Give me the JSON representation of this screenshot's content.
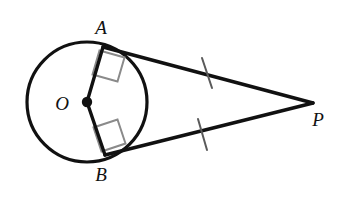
{
  "figure": {
    "background_color": "#ffffff",
    "stroke_color": "#111111",
    "right_angle_color": "#8a8a8a",
    "tick_color": "#5a5a5a",
    "width": 358,
    "height": 199
  },
  "labels": {
    "center": "O",
    "tangent_point_upper": "A",
    "tangent_point_lower": "B",
    "external_point": "P"
  },
  "geometry": {
    "circle": {
      "center_x": 87,
      "center_y": 102,
      "radius": 60,
      "stroke_width": 3.2
    },
    "points": {
      "O": {
        "x": 87,
        "y": 102
      },
      "A": {
        "x": 103,
        "y": 47
      },
      "B": {
        "x": 105,
        "y": 155
      },
      "P": {
        "x": 313,
        "y": 103
      }
    },
    "label_positions": {
      "O": {
        "x": 62,
        "y": 110
      },
      "A": {
        "x": 101,
        "y": 34
      },
      "B": {
        "x": 101,
        "y": 181
      },
      "P": {
        "x": 318,
        "y": 126
      }
    },
    "segments": [
      {
        "name": "radius-OA",
        "x1": 87,
        "y1": 102,
        "x2": 103,
        "y2": 47,
        "width": 3.4
      },
      {
        "name": "radius-OB",
        "x1": 87,
        "y1": 102,
        "x2": 105,
        "y2": 155,
        "width": 3.4
      },
      {
        "name": "tangent-AP",
        "x1": 103,
        "y1": 47,
        "x2": 313,
        "y2": 103,
        "width": 3.4
      },
      {
        "name": "tangent-BP",
        "x1": 105,
        "y1": 155,
        "x2": 313,
        "y2": 103,
        "width": 3.4
      }
    ],
    "right_angle_marks": [
      {
        "name": "right-angle-at-A",
        "points": "99.5,50.5 124.5,57.5 117.5,81.5 92.5,74.5",
        "width": 2.0
      },
      {
        "name": "right-angle-at-B",
        "points": "101.5,151.5 125.5,143.5 117.5,119.5 93.5,127.5",
        "width": 2.0
      }
    ],
    "tick_marks": [
      {
        "name": "congruence-tick-AP",
        "x1": 202,
        "y1": 58,
        "x2": 212,
        "y2": 88,
        "width": 2.0
      },
      {
        "name": "congruence-tick-BP",
        "x1": 198,
        "y1": 119,
        "x2": 207,
        "y2": 150,
        "width": 2.0
      }
    ],
    "center_dot": {
      "x": 87,
      "y": 102,
      "r": 5.2
    }
  }
}
